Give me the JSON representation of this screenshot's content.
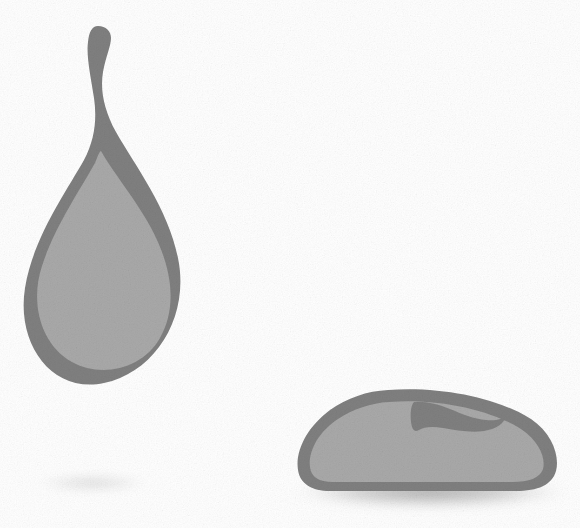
{
  "canvas": {
    "width": 580,
    "height": 528,
    "background_color": "#ffffff",
    "texture": "fine-grain-noise"
  },
  "palette": {
    "outline_gray": "#808080",
    "fill_gray": "#a9a9a9",
    "shadow_gray": "#9a9a9a",
    "faint_shadow_gray": "#e8e8e8",
    "background_white": "#ffffff"
  },
  "objects": [
    {
      "id": "droplet",
      "label": "Teardrop",
      "description": "Tall teardrop / water-drop shape with a slender dark stem topped by a small rounded bulb, widening into a round bulb body.",
      "outline_color": "#808080",
      "fill_color": "#a9a9a9",
      "bounds": {
        "x": 25,
        "y": 26,
        "width": 157,
        "height": 359
      },
      "center": {
        "x": 103,
        "y": 250
      },
      "stem": {
        "top_bulb_center": {
          "x": 98,
          "y": 37
        },
        "top_bulb_radius": 11,
        "stem_bottom_y": 160
      }
    },
    {
      "id": "blob",
      "label": "Dome blob",
      "description": "Wide flattened dome / rounded loaf shape resting on the ground, with a dark wedge-shaped notch dipping into its upper right region.",
      "outline_color": "#808080",
      "fill_color": "#a9a9a9",
      "bounds": {
        "x": 297,
        "y": 388,
        "width": 260,
        "height": 104
      },
      "center": {
        "x": 427,
        "y": 443
      },
      "notch": {
        "description": "dark gray wedge indentation in upper right of fill",
        "x": 412,
        "y": 392,
        "width": 92,
        "height": 42
      }
    }
  ],
  "shadows": [
    {
      "id": "droplet-shadow",
      "label": "Faint shadow under teardrop",
      "color": "#e8e8e8",
      "center": {
        "x": 92,
        "y": 483
      },
      "radius_x": 58,
      "radius_y": 10,
      "opacity": 0.9
    },
    {
      "id": "blob-shadow",
      "label": "Soft cast shadow under dome blob",
      "color": "#9a9a9a",
      "center": {
        "x": 430,
        "y": 492
      },
      "radius_x": 137,
      "radius_y": 16,
      "opacity": 0.85
    }
  ],
  "labels": {
    "scene_title": "Two gray shapes on white background",
    "droplet_name": "teardrop-shape",
    "blob_name": "dome-blob-shape"
  }
}
